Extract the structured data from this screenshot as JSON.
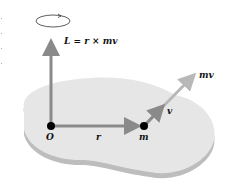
{
  "diagram": {
    "labels": {
      "angular_momentum": "L = r × mv",
      "origin": "O",
      "position": "r",
      "mass": "m",
      "velocity": "v",
      "momentum": "mv"
    },
    "colors": {
      "surface": "#e6e6e6",
      "surface_edge": "#bdbdbd",
      "vector_dark": "#8a8a8a",
      "vector_light": "#b8b8b8",
      "point": "#000000"
    }
  }
}
